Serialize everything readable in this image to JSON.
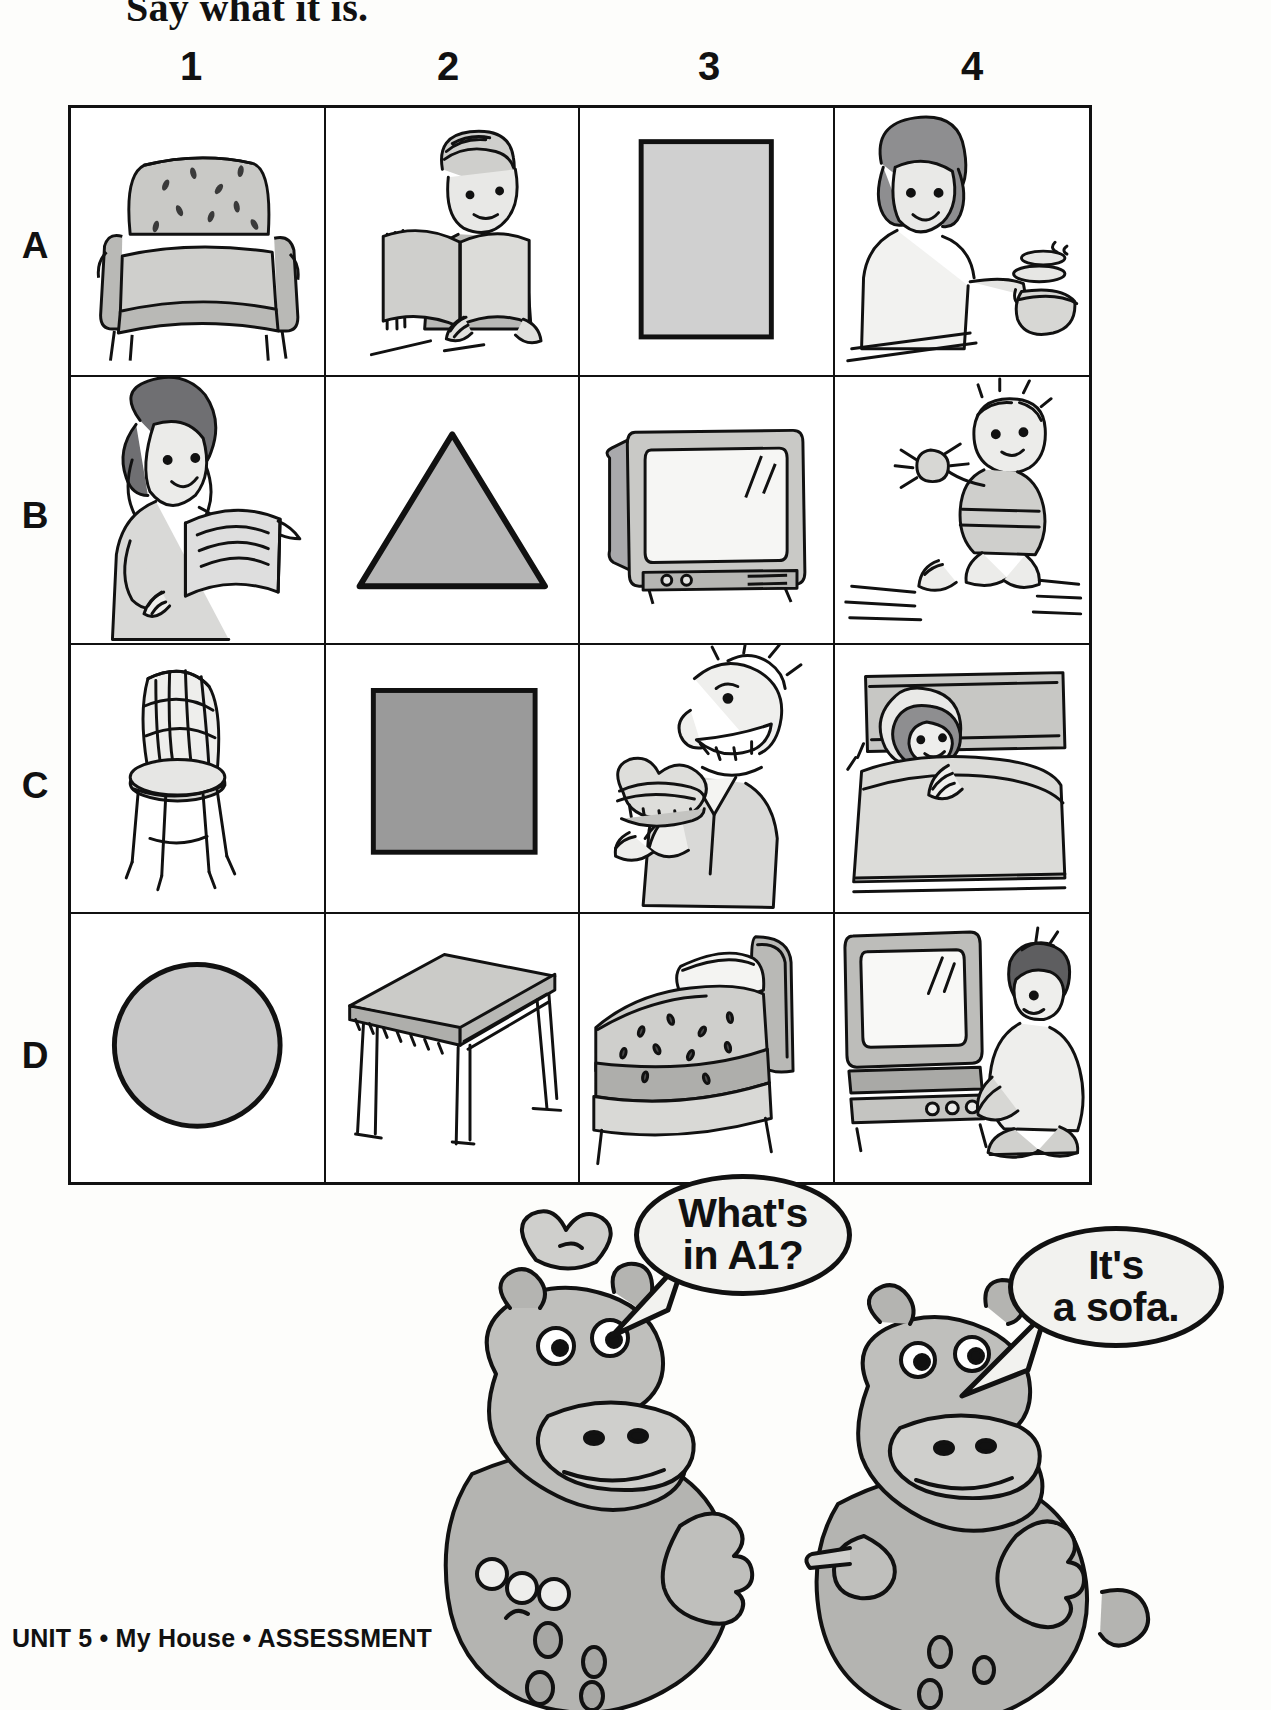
{
  "page": {
    "title": "Say what it is.",
    "footer": "UNIT 5 • My House • ASSESSMENT"
  },
  "grid": {
    "column_headers": [
      "1",
      "2",
      "3",
      "4"
    ],
    "row_headers": [
      "A",
      "B",
      "C",
      "D"
    ],
    "cells": [
      {
        "ref": "A1",
        "item": "sofa",
        "kind": "illustration"
      },
      {
        "ref": "A2",
        "item": "boy reading a book",
        "kind": "illustration"
      },
      {
        "ref": "A3",
        "item": "rectangle",
        "kind": "shape",
        "shape": "rectangle",
        "fill": "#d0d0d0"
      },
      {
        "ref": "A4",
        "item": "woman cooking",
        "kind": "illustration"
      },
      {
        "ref": "B1",
        "item": "woman reading a book",
        "kind": "illustration"
      },
      {
        "ref": "B2",
        "item": "triangle",
        "kind": "shape",
        "shape": "triangle",
        "fill": "#b5b5b5"
      },
      {
        "ref": "B3",
        "item": "television",
        "kind": "illustration"
      },
      {
        "ref": "B4",
        "item": "baby playing with a rattle",
        "kind": "illustration"
      },
      {
        "ref": "C1",
        "item": "chair",
        "kind": "illustration"
      },
      {
        "ref": "C2",
        "item": "square",
        "kind": "shape",
        "shape": "square",
        "fill": "#9a9a9a"
      },
      {
        "ref": "C3",
        "item": "man eating a sandwich",
        "kind": "illustration"
      },
      {
        "ref": "C4",
        "item": "girl sleeping in bed",
        "kind": "illustration"
      },
      {
        "ref": "D1",
        "item": "circle",
        "kind": "shape",
        "shape": "circle",
        "fill": "#c8c8c8"
      },
      {
        "ref": "D2",
        "item": "table",
        "kind": "illustration"
      },
      {
        "ref": "D3",
        "item": "bed",
        "kind": "illustration"
      },
      {
        "ref": "D4",
        "item": "boy watching television",
        "kind": "illustration"
      }
    ]
  },
  "dialogue": {
    "question": {
      "line1": "What's",
      "line2": "in A1?",
      "speaker": "hippo-left"
    },
    "answer": {
      "line1": "It's",
      "line2": "a sofa.",
      "speaker": "hippo-right"
    }
  },
  "colors": {
    "ink": "#111111",
    "paper": "#fdfdfb",
    "bubble_fill": "#f2f2ef",
    "tone_light": "#d7d7d4",
    "tone_mid": "#b9b9b6",
    "tone_dark": "#97979a"
  }
}
